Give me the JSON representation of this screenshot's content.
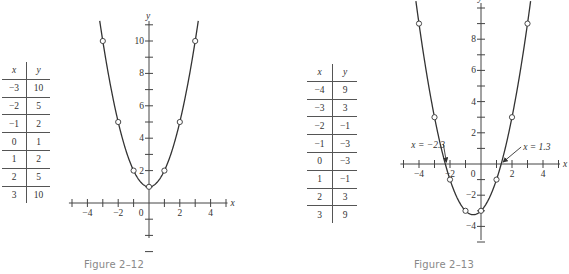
{
  "figures": [
    {
      "caption": "Figure 2–12",
      "table": {
        "headers": [
          "x",
          "y"
        ],
        "rows": [
          [
            "−3",
            "10"
          ],
          [
            "−2",
            "5"
          ],
          [
            "−1",
            "2"
          ],
          [
            "0",
            "1"
          ],
          [
            "1",
            "2"
          ],
          [
            "2",
            "5"
          ],
          [
            "3",
            "10"
          ]
        ]
      }
    },
    {
      "caption": "Figure 2–13",
      "table": {
        "headers": [
          "x",
          "y"
        ],
        "rows": [
          [
            "−4",
            "9"
          ],
          [
            "−3",
            "3"
          ],
          [
            "−2",
            "−1"
          ],
          [
            "−1",
            "−3"
          ],
          [
            "0",
            "−3"
          ],
          [
            "1",
            "−1"
          ],
          [
            "2",
            "3"
          ],
          [
            "3",
            "9"
          ]
        ]
      },
      "annotations": [
        "x = −2.3",
        "x = 1.3"
      ]
    }
  ],
  "chart_data": [
    {
      "type": "line",
      "title": "Figure 2–12",
      "function": "y = x^2 + 1",
      "xlabel": "x",
      "ylabel": "y",
      "x": [
        -3,
        -2,
        -1,
        0,
        1,
        2,
        3
      ],
      "y": [
        10,
        5,
        2,
        1,
        2,
        5,
        10
      ],
      "x_ticks": [
        -4,
        -2,
        0,
        2,
        4
      ],
      "y_ticks": [
        2,
        4,
        6,
        8,
        10
      ],
      "xlim": [
        -5,
        5
      ],
      "ylim": [
        -3,
        11
      ],
      "markers": "open circles",
      "grid": false
    },
    {
      "type": "line",
      "title": "Figure 2–13",
      "function": "y = x^2 + x - 3",
      "xlabel": "x",
      "ylabel": "y",
      "x": [
        -4,
        -3,
        -2,
        -1,
        0,
        1,
        2,
        3
      ],
      "y": [
        9,
        3,
        -1,
        -3,
        -3,
        -1,
        3,
        9
      ],
      "x_ticks": [
        -4,
        -2,
        0,
        2,
        4
      ],
      "y_ticks": [
        -4,
        -2,
        2,
        4,
        6,
        8
      ],
      "xlim": [
        -5,
        5
      ],
      "ylim": [
        -5,
        10
      ],
      "roots_annotated": [
        -2.3,
        1.3
      ],
      "annotations": [
        "x = −2.3",
        "x = 1.3"
      ],
      "markers": "open circles",
      "grid": false
    }
  ]
}
